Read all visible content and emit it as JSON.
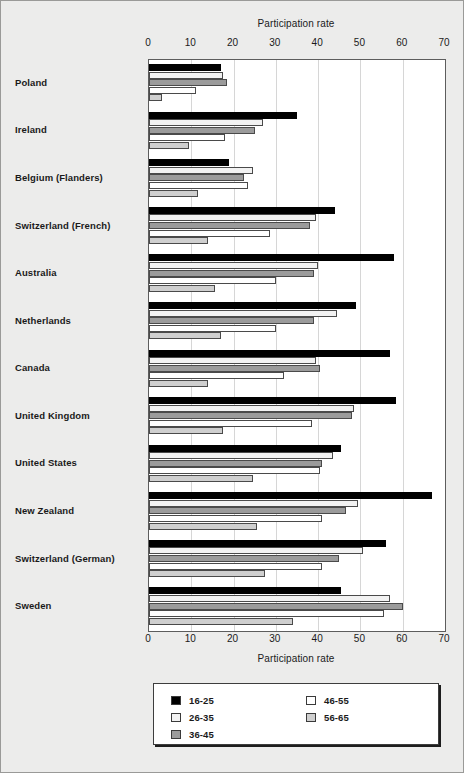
{
  "chart_data": {
    "type": "bar",
    "orientation": "horizontal",
    "title": "",
    "xlabel": "Participation rate",
    "ylabel": "",
    "xlim": [
      0,
      70
    ],
    "xticks": [
      0,
      10,
      20,
      30,
      40,
      50,
      60,
      70
    ],
    "grid": true,
    "legend_position": "bottom",
    "axis_title_top": "Participation rate",
    "axis_title_bottom": "Participation rate",
    "categories": [
      "Poland",
      "Ireland",
      "Belgium (Flanders)",
      "Switzerland (French)",
      "Australia",
      "Netherlands",
      "Canada",
      "United Kingdom",
      "United States",
      "New Zealand",
      "Switzerland (German)",
      "Sweden"
    ],
    "series": [
      {
        "name": "16-25",
        "color": "#000000",
        "values": [
          17.0,
          35.0,
          19.0,
          44.0,
          58.0,
          49.0,
          57.0,
          58.5,
          45.5,
          67.0,
          56.0,
          45.5
        ]
      },
      {
        "name": "26-35",
        "color": "#f2f2f2",
        "values": [
          17.5,
          27.0,
          24.5,
          39.5,
          40.0,
          44.5,
          39.5,
          48.5,
          43.5,
          49.5,
          50.5,
          57.0
        ]
      },
      {
        "name": "36-45",
        "color": "#9b9b9b",
        "values": [
          18.5,
          25.0,
          22.5,
          38.0,
          39.0,
          39.0,
          40.5,
          48.0,
          41.0,
          46.5,
          45.0,
          60.0
        ]
      },
      {
        "name": "46-55",
        "color": "#ffffff",
        "values": [
          11.0,
          18.0,
          23.5,
          28.5,
          30.0,
          30.0,
          32.0,
          38.5,
          40.5,
          41.0,
          41.0,
          55.5
        ]
      },
      {
        "name": "56-65",
        "color": "#cfcfcf",
        "values": [
          3.0,
          9.5,
          11.5,
          14.0,
          15.5,
          17.0,
          14.0,
          17.5,
          24.5,
          25.5,
          27.5,
          34.0
        ]
      }
    ]
  },
  "legend": {
    "column_a": [
      "16-25",
      "26-35",
      "36-45"
    ],
    "column_b": [
      "46-55",
      "56-65"
    ]
  }
}
